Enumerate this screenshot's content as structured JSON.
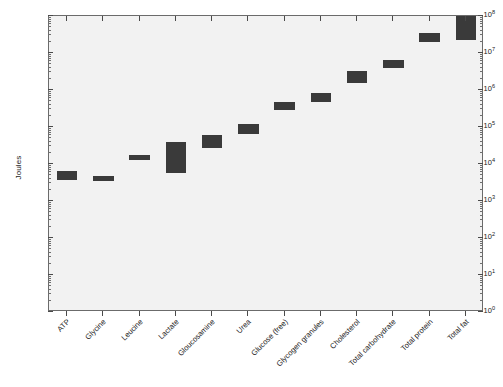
{
  "chart_data": {
    "type": "bar",
    "title": "",
    "xlabel": "",
    "ylabel": "Joules",
    "ylim": [
      1,
      100000000
    ],
    "yscale": "log",
    "grid": false,
    "legend": null,
    "ytick_labels": [
      "10^0",
      "10^1",
      "10^2",
      "10^3",
      "10^4",
      "10^5",
      "10^6",
      "10^7",
      "10^8"
    ],
    "ytick_values": [
      1,
      10,
      100,
      1000,
      10000,
      100000,
      1000000,
      10000000,
      100000000
    ],
    "note": "Each category is drawn as a filled box spanning a low-to-high energy range (floating bar / range bar).",
    "categories": [
      "ATP",
      "Glycine",
      "Leucine",
      "Lactate",
      "Gloucosamine",
      "Urea",
      "Glucose (free)",
      "Glycogen granules",
      "Cholesterol",
      "Total carbohydrate",
      "Total protein",
      "Total fat"
    ],
    "ranges_low": [
      3600,
      3900,
      13000,
      5800,
      27000,
      65000,
      290000,
      480000,
      1500000,
      4000000,
      20000000,
      22000000
    ],
    "ranges_high": [
      6600,
      4800,
      17000,
      39000,
      62000,
      120000,
      460000,
      820000,
      3200000,
      6300000,
      35000000,
      100000000
    ],
    "series": [
      {
        "name": "Energy content range",
        "color": "#3a3a3a",
        "values_low": [
          3600,
          3900,
          13000,
          5800,
          27000,
          65000,
          290000,
          480000,
          1500000,
          4000000,
          20000000,
          22000000
        ],
        "values_high": [
          6600,
          4800,
          17000,
          39000,
          62000,
          120000,
          460000,
          820000,
          3200000,
          6300000,
          35000000,
          100000000
        ]
      }
    ]
  },
  "style": {
    "plot_background": "#f2f2f2",
    "bar_color": "#3a3a3a",
    "axis_color": "#6b6b6b",
    "page_background": "#ffffff"
  }
}
